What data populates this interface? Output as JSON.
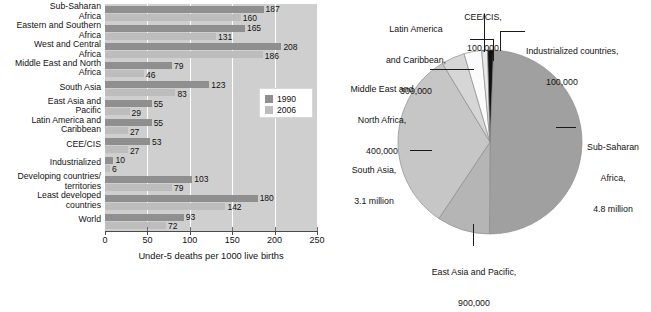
{
  "chart_data": [
    {
      "type": "bar",
      "orientation": "horizontal",
      "title": "",
      "xlabel": "Under-5 deaths per 1000 live births",
      "ylabel": "",
      "xlim": [
        0,
        250
      ],
      "xticks": [
        0,
        50,
        100,
        150,
        200,
        250
      ],
      "grid": true,
      "legend_position": "inside-right",
      "categories": [
        "Sub-Saharan\nAfrica",
        "Eastern and Southern\nAfrica",
        "West and Central\nAfrica",
        "Middle East and North\nAfrica",
        "South Asia",
        "East Asia and\nPacific",
        "Latin America and\nCaribbean",
        "CEE/CIS",
        "Industrialized",
        "Developing countries/\nterritories",
        "Least developed\ncountries",
        "World"
      ],
      "series": [
        {
          "name": "1990",
          "color": "#8f8f8f",
          "values": [
            187,
            165,
            208,
            79,
            123,
            55,
            55,
            53,
            10,
            103,
            180,
            93
          ]
        },
        {
          "name": "2006",
          "color": "#bdbdbd",
          "values": [
            160,
            131,
            186,
            46,
            83,
            29,
            27,
            27,
            6,
            79,
            142,
            72
          ]
        }
      ]
    },
    {
      "type": "pie",
      "title": "",
      "slices": [
        {
          "label": "Sub-Saharan\nAfrica,\n4.8 million",
          "label_lines": [
            "Sub-Saharan",
            "Africa,",
            "4.8 million"
          ],
          "value": 4.8,
          "unit": "million",
          "color": "#a0a0a0"
        },
        {
          "label": "East Asia and Pacific,\n900,000",
          "label_lines": [
            "East Asia and Pacific,",
            "900,000"
          ],
          "value": 0.9,
          "unit": "million",
          "color": "#b5b5b5"
        },
        {
          "label": "South Asia,\n3.1 million",
          "label_lines": [
            "South Asia,",
            "3.1 million"
          ],
          "value": 3.1,
          "unit": "million",
          "color": "#c6c6c6"
        },
        {
          "label": "Middle East and\nNorth Africa,\n400,000",
          "label_lines": [
            "Middle East and",
            "North Africa,",
            "400,000"
          ],
          "value": 0.4,
          "unit": "million",
          "color": "#d6d6d6"
        },
        {
          "label": "Latin America\nand Caribbean,\n300,000",
          "label_lines": [
            "Latin America",
            "and Caribbean,",
            "300,000"
          ],
          "value": 0.3,
          "unit": "million",
          "color": "#fbfbfb"
        },
        {
          "label": "CEE/CIS,\n100,000",
          "label_lines": [
            "CEE/CIS,",
            "100,000"
          ],
          "value": 0.1,
          "unit": "million",
          "color": "#e8e8e8"
        },
        {
          "label": "Industrialized countries,\n100,000",
          "label_lines": [
            "Industrialized countries,",
            "100,000"
          ],
          "value": 0.1,
          "unit": "million",
          "color": "#111111"
        }
      ]
    }
  ],
  "bar_chart": {
    "xaxis_title": "Under-5 deaths per 1000 live births",
    "ticks": [
      "0",
      "50",
      "100",
      "150",
      "200",
      "250"
    ],
    "legend": {
      "items": [
        {
          "label": "1990",
          "color": "#8f8f8f"
        },
        {
          "label": "2006",
          "color": "#bdbdbd"
        }
      ]
    },
    "rows": [
      {
        "label_line1": "Sub-Saharan",
        "label_line2": "Africa",
        "v1990": "187",
        "v2006": "160"
      },
      {
        "label_line1": "Eastern and Southern",
        "label_line2": "Africa",
        "v1990": "165",
        "v2006": "131"
      },
      {
        "label_line1": "West and Central",
        "label_line2": "Africa",
        "v1990": "208",
        "v2006": "186"
      },
      {
        "label_line1": "Middle East and North",
        "label_line2": "Africa",
        "v1990": "79",
        "v2006": "46"
      },
      {
        "label_line1": "South Asia",
        "label_line2": "",
        "v1990": "123",
        "v2006": "83"
      },
      {
        "label_line1": "East Asia and",
        "label_line2": "Pacific",
        "v1990": "55",
        "v2006": "29"
      },
      {
        "label_line1": "Latin America and",
        "label_line2": "Caribbean",
        "v1990": "55",
        "v2006": "27"
      },
      {
        "label_line1": "CEE/CIS",
        "label_line2": "",
        "v1990": "53",
        "v2006": "27"
      },
      {
        "label_line1": "Industrialized",
        "label_line2": "",
        "v1990": "10",
        "v2006": "6"
      },
      {
        "label_line1": "Developing countries/",
        "label_line2": "territories",
        "v1990": "103",
        "v2006": "79"
      },
      {
        "label_line1": "Least developed",
        "label_line2": "countries",
        "v1990": "180",
        "v2006": "142"
      },
      {
        "label_line1": "World",
        "label_line2": "",
        "v1990": "93",
        "v2006": "72"
      }
    ]
  },
  "pie_chart": {
    "labels": {
      "latin_america": {
        "l1": "Latin America",
        "l2": "and Caribbean,",
        "l3": "300,000"
      },
      "cee_cis": {
        "l1": "CEE/CIS,",
        "l2": "100,000"
      },
      "industrialized": {
        "l1": "Industrialized countries,",
        "l2": "100,000"
      },
      "middle_east": {
        "l1": "Middle East and",
        "l2": "North Africa,",
        "l3": "400,000"
      },
      "south_asia": {
        "l1": "South Asia,",
        "l2": "3.1 million"
      },
      "sub_saharan": {
        "l1": "Sub-Saharan",
        "l2": "Africa,",
        "l3": "4.8 million"
      },
      "east_asia": {
        "l1": "East Asia and Pacific,",
        "l2": "900,000"
      }
    }
  }
}
